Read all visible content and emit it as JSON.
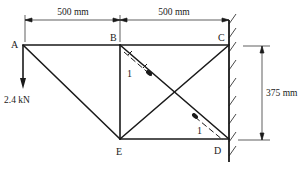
{
  "diagram": {
    "type": "pin-jointed truss attached to wall",
    "nodes": [
      {
        "id": "A",
        "label": "A"
      },
      {
        "id": "B",
        "label": "B"
      },
      {
        "id": "C",
        "label": "C"
      },
      {
        "id": "D",
        "label": "D"
      },
      {
        "id": "E",
        "label": "E"
      }
    ],
    "members": [
      {
        "from": "A",
        "to": "B"
      },
      {
        "from": "B",
        "to": "C"
      },
      {
        "from": "A",
        "to": "E"
      },
      {
        "from": "B",
        "to": "E"
      },
      {
        "from": "E",
        "to": "D"
      },
      {
        "from": "B",
        "to": "D"
      },
      {
        "from": "E",
        "to": "C"
      }
    ],
    "supports": "C and D pinned to vertical wall",
    "dimensions": {
      "ab": "500 mm",
      "bc": "500 mm",
      "cd": "375 mm"
    },
    "load": {
      "node": "A",
      "value": "2.4 kN",
      "direction": "down"
    },
    "strain_gauges": [
      {
        "member": "BD",
        "near": "B",
        "label": "1"
      },
      {
        "member": "BD",
        "near": "D",
        "label": "1"
      }
    ],
    "colors": {
      "line": "#1a1a1a",
      "background": "#ffffff"
    }
  }
}
